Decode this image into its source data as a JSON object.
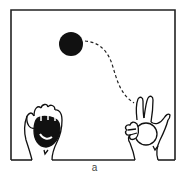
{
  "figure": {
    "caption": "a",
    "elements": {
      "frame": "square-frame",
      "ball_in_air": "filled-black-circle",
      "trajectory": "dashed-curve",
      "left_hand": "fist-holding-dark-ball",
      "right_hand": "v-fingers-holding-hollow-ball"
    },
    "colors": {
      "ink": "#111111",
      "background": "#ffffff"
    }
  }
}
